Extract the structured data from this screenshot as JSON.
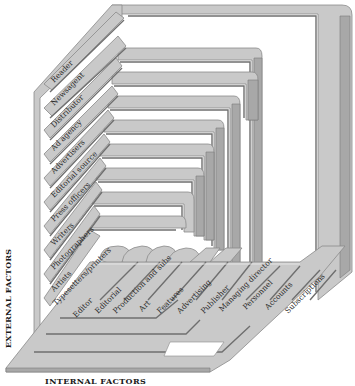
{
  "diagram": {
    "side_label": "EXTERNAL FACTORS",
    "bottom_label": "INTERNAL FACTORS",
    "external_factors": [
      "Reader",
      "Newsagent",
      "Distributor",
      "Ad agency",
      "Advertisers",
      "Editorial source",
      "Press officers",
      "Writers",
      "Photographers",
      "Artists",
      "Typesetters/printers"
    ],
    "internal_factors": [
      "Editor",
      "Editorial",
      "Production and subs",
      "Art",
      "Features",
      "Advertising",
      "Publisher",
      "Managing director",
      "Personnel",
      "Accounts",
      "Subscriptions"
    ],
    "colors": {
      "band_fill": "#c9c9c9",
      "band_edge": "#8a8a8a",
      "band_shadow": "#6f6f6f",
      "background": "#ffffff",
      "text": "#2a2a2a"
    }
  }
}
